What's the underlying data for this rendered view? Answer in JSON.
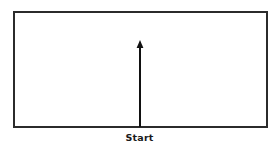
{
  "canvas": {
    "width": 279,
    "height": 151,
    "background_color": "#ffffff"
  },
  "diagram": {
    "type": "movement-direction-diagram",
    "title": "",
    "shapes": {
      "boundary_rect": {
        "name": "field-boundary",
        "x": 13,
        "y": 11,
        "width": 255,
        "height": 117,
        "stroke_color": "#2b2b2b",
        "stroke_width": 2,
        "fill_color": "#ffffff"
      },
      "arrow": {
        "name": "direction-arrow",
        "from_x": 140,
        "from_y": 127,
        "to_x": 140,
        "to_y": 40,
        "direction": "up",
        "color": "#111111",
        "shaft_width": 2,
        "head_width": 7,
        "head_height": 8
      }
    },
    "labels": [
      {
        "id": "start",
        "text": "Start",
        "x": 140,
        "y": 140,
        "color": "#1a1a1a",
        "bold": true
      }
    ]
  }
}
